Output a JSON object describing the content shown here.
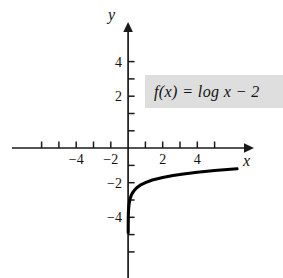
{
  "chart_data": {
    "type": "line",
    "title": "",
    "subtitle": "",
    "xlabel": "x",
    "ylabel": "y",
    "xlim": [
      -6.7,
      7.0
    ],
    "ylim": [
      -7.5,
      7.3
    ],
    "grid": false,
    "legend": "none",
    "annotations": [
      {
        "name": "function-equation",
        "text": "f(x) = log x − 2",
        "style": "gray-highlight-box",
        "box_color": "#dedede"
      }
    ],
    "axes": {
      "x_axis": {
        "label": "x",
        "arrow": true,
        "ticks": [
          -5,
          -4,
          -3,
          -2,
          -1,
          1,
          2,
          3,
          4,
          5
        ],
        "tick_labels": [
          {
            "value": -4,
            "text": "−4"
          },
          {
            "value": -2,
            "text": "−2"
          },
          {
            "value": 2,
            "text": "2"
          },
          {
            "value": 4,
            "text": "4"
          }
        ]
      },
      "y_axis": {
        "label": "y",
        "arrow": true,
        "ticks": [
          5,
          4,
          3,
          2,
          1,
          -1,
          -2,
          -3,
          -4,
          -5,
          -6
        ],
        "tick_labels": [
          {
            "value": 4,
            "text": "4"
          },
          {
            "value": 2,
            "text": "2"
          },
          {
            "value": -2,
            "text": "−2"
          },
          {
            "value": -4,
            "text": "−4"
          }
        ]
      }
    },
    "series": [
      {
        "name": "f(x) = log x - 2",
        "equation": "f(x) = log x - 2",
        "color": "#000000",
        "asymptote": {
          "type": "vertical",
          "x": 0
        },
        "points": [
          {
            "x": 0.012,
            "y": -3.92
          },
          {
            "x": 0.02,
            "y": -3.7
          },
          {
            "x": 0.03,
            "y": -3.52
          },
          {
            "x": 0.05,
            "y": -3.3
          },
          {
            "x": 0.08,
            "y": -3.1
          },
          {
            "x": 0.12,
            "y": -2.92
          },
          {
            "x": 0.18,
            "y": -2.74
          },
          {
            "x": 0.25,
            "y": -2.6
          },
          {
            "x": 0.35,
            "y": -2.46
          },
          {
            "x": 0.5,
            "y": -2.3
          },
          {
            "x": 0.7,
            "y": -2.15
          },
          {
            "x": 1.0,
            "y": -2.0
          },
          {
            "x": 1.4,
            "y": -1.85
          },
          {
            "x": 2.0,
            "y": -1.7
          },
          {
            "x": 2.6,
            "y": -1.59
          },
          {
            "x": 3.2,
            "y": -1.5
          },
          {
            "x": 4.0,
            "y": -1.4
          },
          {
            "x": 5.0,
            "y": -1.3
          },
          {
            "x": 6.3,
            "y": -1.2
          }
        ]
      }
    ]
  },
  "labels": {
    "x_axis_name": "x",
    "y_axis_name": "y",
    "equation": "f(x) = log x − 2"
  }
}
